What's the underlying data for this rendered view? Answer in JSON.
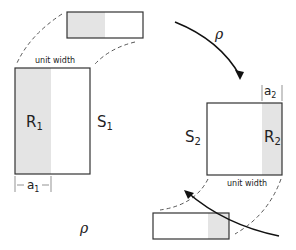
{
  "diagram": {
    "left_rect": {
      "outer_label": "S",
      "outer_sub": "1",
      "region_label": "R",
      "region_sub": "1",
      "width_label": "unit width",
      "dim_label": "a",
      "dim_sub": "1"
    },
    "right_rect": {
      "outer_label": "S",
      "outer_sub": "2",
      "region_label": "R",
      "region_sub": "2",
      "width_label": "unit width",
      "dim_label": "a",
      "dim_sub": "2"
    },
    "arrows": [
      {
        "label": "ρ",
        "direction": "top-to-right"
      },
      {
        "label": "ρ",
        "direction": "bottom-to-left"
      }
    ],
    "colors": {
      "shade": "#e4e4e4",
      "line": "#222222"
    }
  }
}
